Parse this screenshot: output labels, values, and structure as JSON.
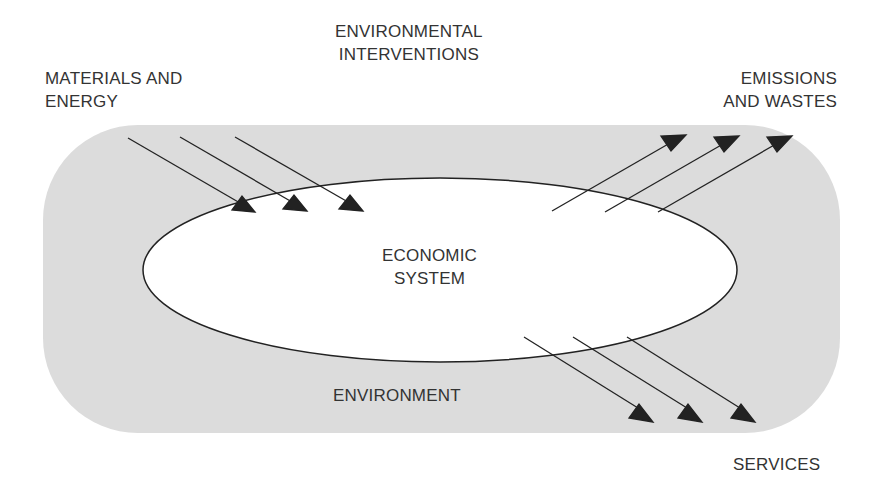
{
  "diagram": {
    "title_label": [
      "ENVIRONMENTAL",
      "INTERVENTIONS"
    ],
    "inputs_label": [
      "MATERIALS AND",
      "ENERGY"
    ],
    "outputs_label": [
      "EMISSIONS",
      "AND WASTES"
    ],
    "services_label": "SERVICES",
    "core_label": [
      "ECONOMIC",
      "SYSTEM"
    ],
    "environment_label": "ENVIRONMENT",
    "colors": {
      "environment_fill": "#dcdcdc",
      "system_fill": "#ffffff",
      "stroke": "#222222",
      "text": "#333333"
    },
    "flows": [
      {
        "group": "materials-and-energy",
        "direction": "into-system",
        "count": 3
      },
      {
        "group": "emissions-and-wastes",
        "direction": "out-of-system",
        "count": 3
      },
      {
        "group": "services",
        "direction": "out-of-system",
        "count": 3
      }
    ]
  }
}
